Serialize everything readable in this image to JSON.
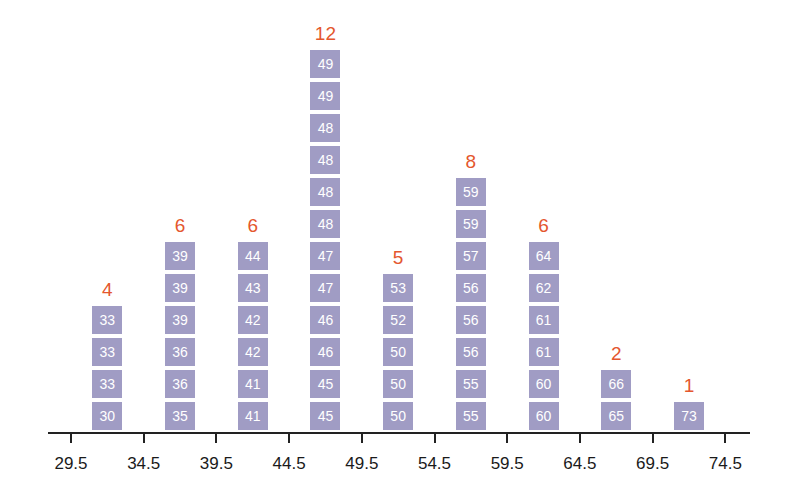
{
  "chart_data": {
    "type": "bar",
    "subtype": "stacked-value-histogram",
    "title": "",
    "xlabel": "",
    "ylabel": "",
    "bin_edges": [
      29.5,
      34.5,
      39.5,
      44.5,
      49.5,
      54.5,
      59.5,
      64.5,
      69.5,
      74.5
    ],
    "categories": [
      "29.5-34.5",
      "34.5-39.5",
      "39.5-44.5",
      "44.5-49.5",
      "49.5-54.5",
      "54.5-59.5",
      "59.5-64.5",
      "64.5-69.5",
      "69.5-74.5"
    ],
    "values": [
      4,
      6,
      6,
      12,
      5,
      8,
      6,
      2,
      1
    ],
    "bins": [
      {
        "count": "4",
        "items": [
          "30",
          "33",
          "33",
          "33"
        ]
      },
      {
        "count": "6",
        "items": [
          "35",
          "36",
          "36",
          "39",
          "39",
          "39"
        ]
      },
      {
        "count": "6",
        "items": [
          "41",
          "41",
          "42",
          "42",
          "43",
          "44"
        ]
      },
      {
        "count": "12",
        "items": [
          "45",
          "45",
          "46",
          "46",
          "47",
          "47",
          "48",
          "48",
          "48",
          "48",
          "49",
          "49"
        ]
      },
      {
        "count": "5",
        "items": [
          "50",
          "50",
          "50",
          "52",
          "53"
        ]
      },
      {
        "count": "8",
        "items": [
          "55",
          "55",
          "56",
          "56",
          "56",
          "57",
          "59",
          "59"
        ]
      },
      {
        "count": "6",
        "items": [
          "60",
          "60",
          "61",
          "61",
          "62",
          "64"
        ]
      },
      {
        "count": "2",
        "items": [
          "65",
          "66"
        ]
      },
      {
        "count": "1",
        "items": [
          "73"
        ]
      }
    ],
    "tick_labels": [
      "29.5",
      "34.5",
      "39.5",
      "44.5",
      "49.5",
      "54.5",
      "59.5",
      "64.5",
      "69.5",
      "74.5"
    ],
    "grid": false,
    "legend": null,
    "colors": {
      "box": "#a09cc4",
      "box_text": "#ffffff",
      "count": "#e4572e",
      "axis": "#222222"
    }
  }
}
